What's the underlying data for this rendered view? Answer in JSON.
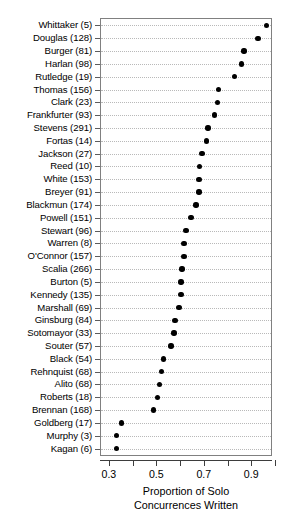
{
  "chart_data": {
    "type": "scatter",
    "orientation": "horizontal",
    "title": "",
    "xlabel_line1": "Proportion of Solo",
    "xlabel_line2": "Concurrences Written",
    "ylabel": "",
    "xlim": [
      0.2667,
      0.9833
    ],
    "xticks": [
      0.3,
      0.4,
      0.5,
      0.6,
      0.7,
      0.8,
      0.9,
      1.0
    ],
    "xticklabels": [
      "0.3",
      "",
      "0.5",
      "",
      "0.7",
      "",
      "0.9",
      ""
    ],
    "grid": "horizontal-dotted",
    "legend": "none",
    "point_color": "#000000",
    "grid_color": "#b9b9b9",
    "frame_color": "#808080",
    "categories": [
      "Whittaker (5)",
      "Douglas (128)",
      "Burger (81)",
      "Harlan (98)",
      "Rutledge (19)",
      "Thomas (156)",
      "Clark (23)",
      "Frankfurter (93)",
      "Stevens (291)",
      "Fortas (14)",
      "Jackson (27)",
      "Reed (10)",
      "White (153)",
      "Breyer (91)",
      "Blackmun (174)",
      "Powell (151)",
      "Stewart (96)",
      "Warren (8)",
      "O'Connor (157)",
      "Scalia (266)",
      "Burton (5)",
      "Kennedy (135)",
      "Marshall (69)",
      "Ginsburg (84)",
      "Sotomayor (33)",
      "Souter (57)",
      "Black (54)",
      "Rehnquist (68)",
      "Alito (68)",
      "Roberts (18)",
      "Brennan (168)",
      "Goldberg (17)",
      "Murphy (3)",
      "Kagan (6)"
    ],
    "values": [
      0.965,
      0.928,
      0.87,
      0.858,
      0.829,
      0.762,
      0.758,
      0.746,
      0.717,
      0.712,
      0.692,
      0.683,
      0.679,
      0.679,
      0.667,
      0.646,
      0.625,
      0.617,
      0.617,
      0.608,
      0.604,
      0.604,
      0.596,
      0.579,
      0.575,
      0.562,
      0.529,
      0.521,
      0.512,
      0.504,
      0.488,
      0.354,
      0.333,
      0.333
    ]
  }
}
